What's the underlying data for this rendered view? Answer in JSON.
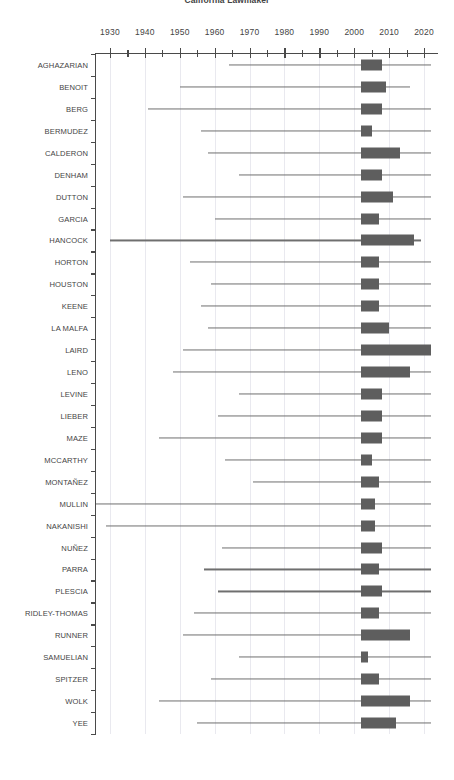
{
  "chart_data": {
    "type": "bar",
    "title": "California Lawmaker",
    "xlabel": "",
    "ylabel": "",
    "xlim": [
      1926,
      2024
    ],
    "grid": true,
    "legend": null,
    "xticks": [
      1930,
      1940,
      1950,
      1960,
      1970,
      1980,
      1990,
      2000,
      2010,
      2020
    ],
    "xticklabels": [
      "1930",
      "1940",
      "1950",
      "1960",
      "1970",
      "1980",
      "1990",
      "2000",
      "2010",
      "2020"
    ],
    "xminorticks": [
      1935,
      1945,
      1955,
      1965,
      1975,
      1985,
      1995,
      2005,
      2015
    ],
    "categories": [
      "AGHAZARIAN",
      "BENOIT",
      "BERG",
      "BERMUDEZ",
      "CALDERON",
      "DENHAM",
      "DUTTON",
      "GARCIA",
      "HANCOCK",
      "HORTON",
      "HOUSTON",
      "KEENE",
      "LA MALFA",
      "LAIRD",
      "LENO",
      "LEVINE",
      "LIEBER",
      "MAZE",
      "MCCARTHY",
      "MONTAÑEZ",
      "MULLIN",
      "NAKANISHI",
      "NUÑEZ",
      "PARRA",
      "PLESCIA",
      "RIDLEY-THOMAS",
      "RUNNER",
      "SAMUELIAN",
      "SPITZER",
      "WOLK",
      "YEE"
    ],
    "series": [
      {
        "name": "whisker_range",
        "label": "full range",
        "color": "#6f6f6f",
        "values": [
          [
            1964,
            2022
          ],
          [
            1950,
            2016
          ],
          [
            1941,
            2022
          ],
          [
            1956,
            2022
          ],
          [
            1958,
            2022
          ],
          [
            1967,
            2022
          ],
          [
            1951,
            2022
          ],
          [
            1960,
            2022
          ],
          [
            1930,
            2019
          ],
          [
            1953,
            2022
          ],
          [
            1959,
            2022
          ],
          [
            1956,
            2022
          ],
          [
            1958,
            2022
          ],
          [
            1951,
            2022
          ],
          [
            1948,
            2022
          ],
          [
            1967,
            2022
          ],
          [
            1961,
            2022
          ],
          [
            1944,
            2022
          ],
          [
            1963,
            2022
          ],
          [
            1971,
            2022
          ],
          [
            1926,
            2022
          ],
          [
            1929,
            2022
          ],
          [
            1962,
            2022
          ],
          [
            1957,
            2022
          ],
          [
            1961,
            2022
          ],
          [
            1954,
            2022
          ],
          [
            1951,
            2016
          ],
          [
            1967,
            2022
          ],
          [
            1959,
            2022
          ],
          [
            1944,
            2022
          ],
          [
            1955,
            2022
          ]
        ]
      },
      {
        "name": "box_range",
        "label": "service span",
        "color": "#5e5e5e",
        "values": [
          [
            2002,
            2008
          ],
          [
            2002,
            2009
          ],
          [
            2002,
            2008
          ],
          [
            2002,
            2005
          ],
          [
            2002,
            2013
          ],
          [
            2002,
            2008
          ],
          [
            2002,
            2011
          ],
          [
            2002,
            2007
          ],
          [
            2002,
            2017
          ],
          [
            2002,
            2007
          ],
          [
            2002,
            2007
          ],
          [
            2002,
            2007
          ],
          [
            2002,
            2010
          ],
          [
            2002,
            2022
          ],
          [
            2002,
            2016
          ],
          [
            2002,
            2008
          ],
          [
            2002,
            2008
          ],
          [
            2002,
            2008
          ],
          [
            2002,
            2005
          ],
          [
            2002,
            2007
          ],
          [
            2002,
            2006
          ],
          [
            2002,
            2006
          ],
          [
            2002,
            2008
          ],
          [
            2002,
            2007
          ],
          [
            2002,
            2008
          ],
          [
            2002,
            2007
          ],
          [
            2002,
            2016
          ],
          [
            2002,
            2004
          ],
          [
            2002,
            2007
          ],
          [
            2002,
            2016
          ],
          [
            2002,
            2012
          ]
        ]
      }
    ]
  }
}
